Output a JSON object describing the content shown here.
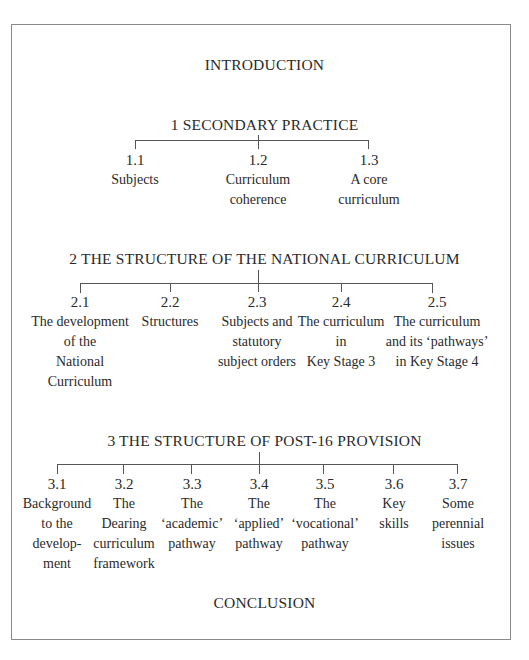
{
  "introduction": "INTRODUCTION",
  "conclusion": "CONCLUSION",
  "sections": [
    {
      "title": "1  SECONDARY PRACTICE",
      "children": [
        {
          "num": "1.1",
          "label": "Subjects"
        },
        {
          "num": "1.2",
          "label": "Curriculum\ncoherence"
        },
        {
          "num": "1.3",
          "label": "A core\ncurriculum"
        }
      ]
    },
    {
      "title": "2  THE STRUCTURE OF THE NATIONAL CURRICULUM",
      "children": [
        {
          "num": "2.1",
          "label": "The development\nof the\nNational\nCurriculum"
        },
        {
          "num": "2.2",
          "label": "Structures"
        },
        {
          "num": "2.3",
          "label": "Subjects and\nstatutory\nsubject orders"
        },
        {
          "num": "2.4",
          "label": "The curriculum\nin\nKey Stage 3"
        },
        {
          "num": "2.5",
          "label": "The curriculum\nand its ‘pathways’\nin Key Stage 4"
        }
      ]
    },
    {
      "title": "3  THE STRUCTURE OF POST-16 PROVISION",
      "children": [
        {
          "num": "3.1",
          "label": "Background\nto the\ndevelop-\nment"
        },
        {
          "num": "3.2",
          "label": "The\nDearing\ncurriculum\nframework"
        },
        {
          "num": "3.3",
          "label": "The\n‘academic’\npathway"
        },
        {
          "num": "3.4",
          "label": "The\n‘applied’\npathway"
        },
        {
          "num": "3.5",
          "label": "The\n‘vocational’\npathway"
        },
        {
          "num": "3.6",
          "label": "Key\nskills"
        },
        {
          "num": "3.7",
          "label": "Some\nperennial\nissues"
        }
      ]
    }
  ]
}
